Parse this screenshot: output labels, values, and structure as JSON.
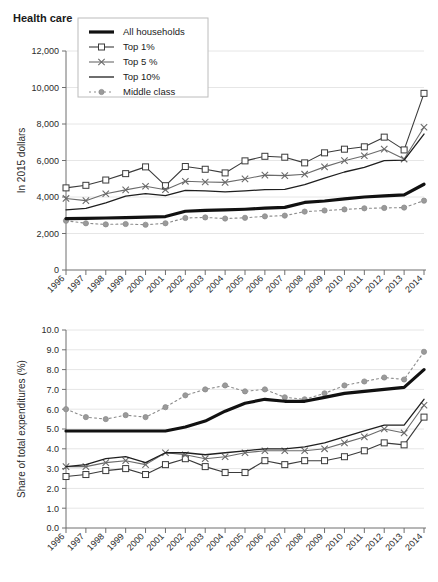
{
  "figure": {
    "title": "Health care",
    "background": "#ffffff"
  },
  "series_styles": {
    "all_households": {
      "color": "#111111",
      "width": 3.2,
      "dash": "none",
      "marker": "none"
    },
    "top1": {
      "color": "#3b3b3b",
      "width": 1.1,
      "dash": "none",
      "marker": "square"
    },
    "top5": {
      "color": "#6b6b6b",
      "width": 1.1,
      "dash": "none",
      "marker": "x"
    },
    "top10": {
      "color": "#1f1f1f",
      "width": 1.3,
      "dash": "none",
      "marker": "none"
    },
    "middle": {
      "color": "#8d8d8d",
      "width": 1.1,
      "dash": "2,3",
      "marker": "circle"
    }
  },
  "legend": {
    "position": "top-left-inside",
    "entries": [
      {
        "key": "all_households",
        "label": "All households"
      },
      {
        "key": "top1",
        "label": "Top 1%"
      },
      {
        "key": "top5",
        "label": "Top 5 %"
      },
      {
        "key": "top10",
        "label": "Top 10%"
      },
      {
        "key": "middle",
        "label": "Middle class"
      }
    ]
  },
  "chart_data": [
    {
      "id": "health-care-dollars",
      "type": "line",
      "title": "Health care",
      "xlabel": "",
      "ylabel": "In 2015 dollars",
      "grid": true,
      "legend": "inside top-left",
      "x": [
        1996,
        1997,
        1998,
        1999,
        2000,
        2001,
        2002,
        2003,
        2004,
        2005,
        2006,
        2007,
        2008,
        2009,
        2010,
        2011,
        2012,
        2013,
        2014
      ],
      "xticklabels": [
        "1996",
        "1997",
        "1998",
        "1999",
        "2000",
        "2001",
        "2002",
        "2003",
        "2004",
        "2005",
        "2006",
        "2007",
        "2008",
        "2009",
        "2010",
        "2011",
        "2012",
        "2013",
        "2014"
      ],
      "ylim": [
        0,
        12000
      ],
      "yticks": [
        0,
        2000,
        4000,
        6000,
        8000,
        10000,
        12000
      ],
      "yticklabels": [
        "0",
        "2,000",
        "4,000",
        "6,000",
        "8,000",
        "10,000",
        "12,000"
      ],
      "series": [
        {
          "name": "All households",
          "key": "all_households",
          "values": [
            2820,
            2830,
            2850,
            2870,
            2900,
            2930,
            3220,
            3270,
            3290,
            3330,
            3390,
            3430,
            3700,
            3780,
            3900,
            4000,
            4060,
            4120,
            4700
          ]
        },
        {
          "name": "Top 1%",
          "key": "top1",
          "values": [
            4500,
            4640,
            4930,
            5280,
            5650,
            4620,
            5670,
            5520,
            5320,
            5980,
            6230,
            6180,
            5870,
            6420,
            6620,
            6750,
            7280,
            6580,
            9680
          ]
        },
        {
          "name": "Top 5 %",
          "key": "top5",
          "values": [
            3920,
            3800,
            4180,
            4390,
            4590,
            4400,
            4860,
            4820,
            4800,
            4990,
            5200,
            5170,
            5250,
            5650,
            5990,
            6260,
            6620,
            6080,
            7820
          ]
        },
        {
          "name": "Top 10%",
          "key": "top10",
          "values": [
            3300,
            3380,
            3680,
            4050,
            4180,
            4080,
            4360,
            4340,
            4280,
            4340,
            4400,
            4420,
            4680,
            5040,
            5370,
            5620,
            5990,
            6020,
            7450
          ]
        },
        {
          "name": "Middle class",
          "key": "middle",
          "values": [
            2700,
            2560,
            2500,
            2520,
            2480,
            2560,
            2850,
            2880,
            2820,
            2860,
            2940,
            2980,
            3200,
            3260,
            3320,
            3380,
            3400,
            3420,
            3800
          ]
        }
      ]
    },
    {
      "id": "health-care-share",
      "type": "line",
      "title": "",
      "xlabel": "",
      "ylabel": "Share of total expenditures (%)",
      "grid": true,
      "legend": "none",
      "x": [
        1996,
        1997,
        1998,
        1999,
        2000,
        2001,
        2002,
        2003,
        2004,
        2005,
        2006,
        2007,
        2008,
        2009,
        2010,
        2011,
        2012,
        2013,
        2014
      ],
      "xticklabels": [
        "1996",
        "1997",
        "1998",
        "1999",
        "2000",
        "2001",
        "2002",
        "2003",
        "2004",
        "2005",
        "2006",
        "2007",
        "2008",
        "2009",
        "2010",
        "2011",
        "2012",
        "2013",
        "2014"
      ],
      "ylim": [
        0,
        10
      ],
      "yticks": [
        0,
        1,
        2,
        3,
        4,
        5,
        6,
        7,
        8,
        9,
        10
      ],
      "yticklabels": [
        "0.0",
        "1.0",
        "2.0",
        "3.0",
        "4.0",
        "5.0",
        "6.0",
        "7.0",
        "8.0",
        "9.0",
        "10.0"
      ],
      "series": [
        {
          "name": "All households",
          "key": "all_households",
          "values": [
            4.9,
            4.9,
            4.9,
            4.9,
            4.9,
            4.9,
            5.1,
            5.4,
            5.9,
            6.3,
            6.5,
            6.4,
            6.4,
            6.6,
            6.8,
            6.9,
            7.0,
            7.1,
            8.0
          ]
        },
        {
          "name": "Top 1%",
          "key": "top1",
          "values": [
            2.6,
            2.7,
            2.9,
            3.0,
            2.7,
            3.2,
            3.5,
            3.1,
            2.8,
            2.8,
            3.4,
            3.2,
            3.4,
            3.4,
            3.6,
            3.9,
            4.3,
            4.2,
            5.6
          ]
        },
        {
          "name": "Top 5 %",
          "key": "top5",
          "values": [
            3.1,
            3.1,
            3.3,
            3.4,
            3.2,
            3.8,
            3.7,
            3.5,
            3.6,
            3.8,
            3.9,
            3.9,
            3.9,
            4.0,
            4.3,
            4.6,
            5.0,
            4.8,
            6.2
          ]
        },
        {
          "name": "Top 10%",
          "key": "top10",
          "values": [
            3.1,
            3.2,
            3.5,
            3.6,
            3.3,
            3.8,
            3.8,
            3.7,
            3.8,
            3.9,
            4.0,
            4.0,
            4.1,
            4.3,
            4.6,
            4.9,
            5.2,
            5.2,
            6.5
          ]
        },
        {
          "name": "Middle class",
          "key": "middle",
          "values": [
            6.0,
            5.6,
            5.5,
            5.7,
            5.6,
            6.1,
            6.7,
            7.0,
            7.2,
            6.9,
            7.0,
            6.6,
            6.5,
            6.8,
            7.2,
            7.4,
            7.6,
            7.5,
            8.9
          ]
        }
      ]
    }
  ]
}
